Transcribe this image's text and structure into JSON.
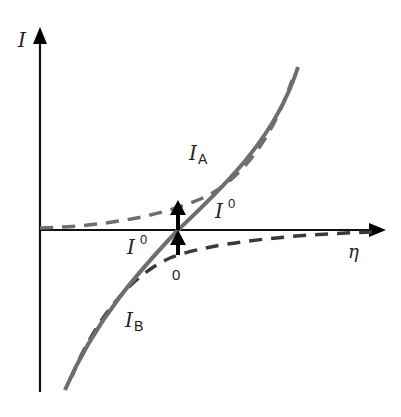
{
  "diagram": {
    "type": "current-overpotential",
    "axes": {
      "y_label": "I",
      "x_label": "η",
      "origin_label": "0"
    },
    "curves": {
      "net": {
        "style": "solid",
        "color": "#6e6e6e"
      },
      "anodic": {
        "label": "I",
        "subscript": "A",
        "style": "dashed",
        "color": "#6e6e6e"
      },
      "cathodic": {
        "label": "I",
        "subscript": "B",
        "style": "dashed",
        "color": "#333333"
      }
    },
    "exchange_current_labels": {
      "upper": {
        "base": "I",
        "superscript": "0"
      },
      "lower": {
        "base": "I",
        "superscript": "0"
      }
    },
    "colors": {
      "axis": "#111111",
      "arrow": "#000000",
      "solid_curve": "#6e6e6e",
      "dashed_a": "#6e6e6e",
      "dashed_b": "#3a3a3a"
    }
  }
}
